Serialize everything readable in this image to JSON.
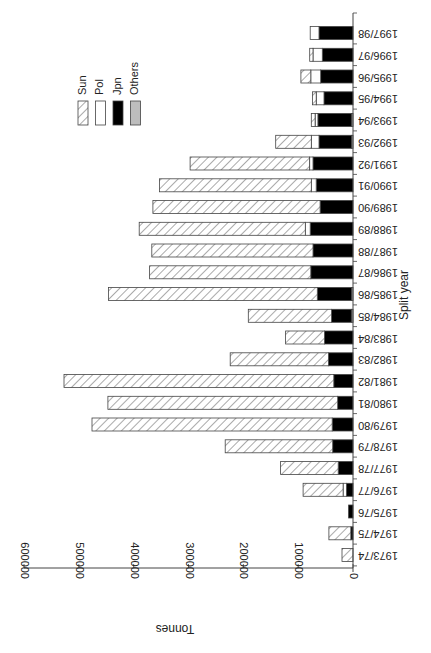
{
  "chart_data": {
    "type": "bar",
    "orientation": "horizontal-stacked, figure rotated 180 degrees",
    "title": "",
    "xlabel": "Split year",
    "ylabel": "Tonnes",
    "ylim": [
      0,
      600000
    ],
    "yticks": [
      0,
      100000,
      200000,
      300000,
      400000,
      500000,
      600000
    ],
    "ytick_labels": [
      "0",
      "100000",
      "200000",
      "300000",
      "400000",
      "500000",
      "600000"
    ],
    "legend": [
      "Sun",
      "Pol",
      "Jpn",
      "Others"
    ],
    "legend_position": "upper-right (as rotated)",
    "grid": false,
    "categories": [
      "1973/74",
      "1974/75",
      "1975/76",
      "1976/77",
      "1977/78",
      "1978/79",
      "1979/80",
      "1980/81",
      "1981/82",
      "1982/83",
      "1983/84",
      "1984/85",
      "1985/86",
      "1986/87",
      "1987/88",
      "1988/89",
      "1989/90",
      "1990/91",
      "1991/92",
      "1992/93",
      "1993/94",
      "1994/95",
      "1995/96",
      "1996/97",
      "1997/98"
    ],
    "series": [
      {
        "name": "Others",
        "pattern": "grey",
        "values": [
          0,
          0,
          0,
          0,
          0,
          0,
          0,
          0,
          0,
          0,
          0,
          3000,
          3000,
          0,
          0,
          0,
          0,
          0,
          0,
          3000,
          3000,
          0,
          0,
          0,
          0
        ]
      },
      {
        "name": "Jpn",
        "pattern": "black",
        "values": [
          0,
          4000,
          8000,
          12000,
          27000,
          37000,
          38000,
          28000,
          35000,
          45000,
          52000,
          36000,
          62000,
          77000,
          73000,
          78000,
          60000,
          67000,
          73000,
          59000,
          61000,
          53000,
          59000,
          56000,
          62000
        ]
      },
      {
        "name": "Pol",
        "pattern": "white",
        "values": [
          0,
          0,
          0,
          6000,
          0,
          0,
          0,
          0,
          0,
          0,
          0,
          0,
          0,
          0,
          0,
          9000,
          0,
          9000,
          6000,
          14000,
          5000,
          14000,
          18000,
          17000,
          16000
        ]
      },
      {
        "name": "Sun",
        "pattern": "hatched",
        "values": [
          20000,
          40000,
          0,
          73000,
          105000,
          196000,
          438000,
          419000,
          492000,
          179000,
          71000,
          152000,
          381000,
          294000,
          294000,
          303000,
          305000,
          277000,
          218000,
          65000,
          7000,
          7000,
          18000,
          6000,
          0
        ]
      }
    ]
  },
  "legend": {
    "items": [
      {
        "label": "Sun",
        "fill": "hatched"
      },
      {
        "label": "Pol",
        "fill": "#ffffff"
      },
      {
        "label": "Jpn",
        "fill": "#000000"
      },
      {
        "label": "Others",
        "fill": "#bdbdbd"
      }
    ]
  },
  "axis": {
    "value_label": "Tonnes",
    "category_label": "Split year"
  },
  "colors": {
    "jpn": "#000000",
    "pol": "#ffffff",
    "others": "#bdbdbd",
    "hatch": "#555555",
    "outline": "#444444"
  }
}
